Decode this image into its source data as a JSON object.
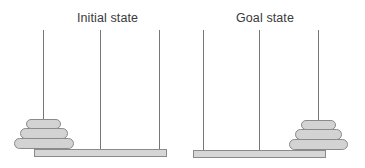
{
  "diagram": {
    "type": "tower-of-hanoi",
    "panels": [
      {
        "id": "initial",
        "title": "Initial state",
        "pegs": 3,
        "disc_peg": 1,
        "discs": [
          "small",
          "medium",
          "large"
        ]
      },
      {
        "id": "goal",
        "title": "Goal state",
        "pegs": 3,
        "disc_peg": 3,
        "discs": [
          "small",
          "medium",
          "large"
        ]
      }
    ],
    "colors": {
      "disc_fill": "#d3d3d3",
      "outline": "#8a8a8a",
      "base_fill": "#d6d6d6",
      "peg": "#777777",
      "text": "#3a3a3a"
    }
  }
}
